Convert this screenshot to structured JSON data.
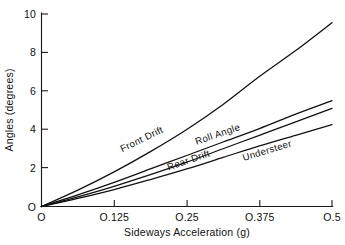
{
  "chart_data": {
    "type": "line",
    "title": "",
    "xlabel": "Sideways Acceleration (g)",
    "ylabel": "Angles (degrees)",
    "xlim": [
      0,
      0.5
    ],
    "ylim": [
      0,
      10
    ],
    "grid": false,
    "legend_position": "inline-curve-labels",
    "xticks": [
      0,
      0.125,
      0.25,
      0.375,
      0.5
    ],
    "xtick_labels": [
      "O",
      "O.125",
      "O.25",
      "O.375",
      "O.5"
    ],
    "yticks": [
      0,
      2,
      4,
      6,
      8,
      10
    ],
    "ytick_labels": [
      "O",
      "2",
      "4",
      "6",
      "8",
      "10"
    ],
    "x": [
      0,
      0.0625,
      0.125,
      0.1875,
      0.25,
      0.3125,
      0.375,
      0.4375,
      0.5
    ],
    "series": [
      {
        "name": "Front Drift",
        "label": "Front Drift",
        "values": [
          0,
          0.85,
          1.8,
          2.85,
          4.0,
          5.3,
          6.75,
          8.1,
          9.55
        ],
        "label_x": 0.175,
        "label_y": 3.35,
        "label_angle": -26
      },
      {
        "name": "Roll Angle",
        "label": "Roll Angle",
        "values": [
          0,
          0.6,
          1.25,
          1.95,
          2.65,
          3.35,
          4.05,
          4.8,
          5.5
        ],
        "label_x": 0.305,
        "label_y": 3.6,
        "label_angle": -19
      },
      {
        "name": "Rear Drift",
        "label": "Rear Drift",
        "values": [
          0,
          0.5,
          1.05,
          1.65,
          2.3,
          3.0,
          3.7,
          4.4,
          5.1
        ],
        "label_x": 0.255,
        "label_y": 2.25,
        "label_angle": -19
      },
      {
        "name": "Understeer",
        "label": "Understeer",
        "values": [
          0,
          0.42,
          0.88,
          1.4,
          1.95,
          2.55,
          3.15,
          3.7,
          4.25
        ],
        "label_x": 0.39,
        "label_y": 2.75,
        "label_angle": -17
      }
    ]
  },
  "axes": {
    "x_title": "Sideways Acceleration (g)",
    "y_title": "Angles (degrees)"
  }
}
